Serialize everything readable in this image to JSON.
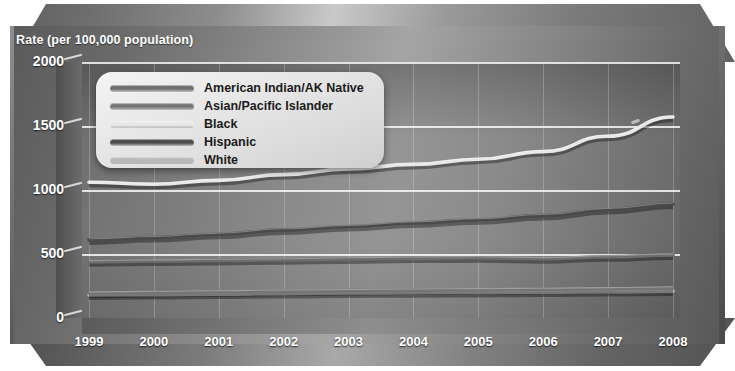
{
  "axis": {
    "y_title": "Rate (per 100,000 population)",
    "y_ticks": [
      "2000",
      "1500",
      "1000",
      "500",
      "0"
    ],
    "x_ticks": [
      "1999",
      "2000",
      "2001",
      "2002",
      "2003",
      "2004",
      "2005",
      "2006",
      "2007",
      "2008"
    ]
  },
  "legend": {
    "items": [
      {
        "label": "American Indian/AK Native",
        "color": "#6e6e6e"
      },
      {
        "label": "Asian/Pacific Islander",
        "color": "#757575"
      },
      {
        "label": "Black",
        "color": "#e8e8e8"
      },
      {
        "label": "Hispanic",
        "color": "#4a4a4a"
      },
      {
        "label": "White",
        "color": "#b9b9b9"
      }
    ]
  },
  "chart_data": {
    "type": "line",
    "title": "",
    "xlabel": "",
    "ylabel": "Rate (per 100,000 population)",
    "x": [
      1999,
      2000,
      2001,
      2002,
      2003,
      2004,
      2005,
      2006,
      2007,
      2008
    ],
    "ylim": [
      0,
      2000
    ],
    "yticks": [
      0,
      500,
      1000,
      1500,
      2000
    ],
    "grid": true,
    "legend_position": "top-left",
    "series": [
      {
        "name": "American Indian/AK Native",
        "color": "#6e6e6e",
        "values": [
          440,
          445,
          450,
          455,
          462,
          468,
          470,
          463,
          478,
          492
        ]
      },
      {
        "name": "Asian/Pacific Islander",
        "color": "#757575",
        "values": [
          195,
          200,
          205,
          210,
          214,
          218,
          221,
          224,
          229,
          235
        ]
      },
      {
        "name": "Black",
        "color": "#e8e8e8",
        "values": [
          1060,
          1045,
          1075,
          1120,
          1165,
          1200,
          1240,
          1300,
          1420,
          1570
        ]
      },
      {
        "name": "Hispanic",
        "color": "#4a4a4a",
        "values": [
          610,
          628,
          655,
          688,
          715,
          742,
          768,
          800,
          848,
          890
        ]
      },
      {
        "name": "White",
        "color": "#b9b9b9",
        "values": [
          180,
          183,
          187,
          191,
          195,
          198,
          200,
          202,
          206,
          210
        ]
      }
    ]
  }
}
